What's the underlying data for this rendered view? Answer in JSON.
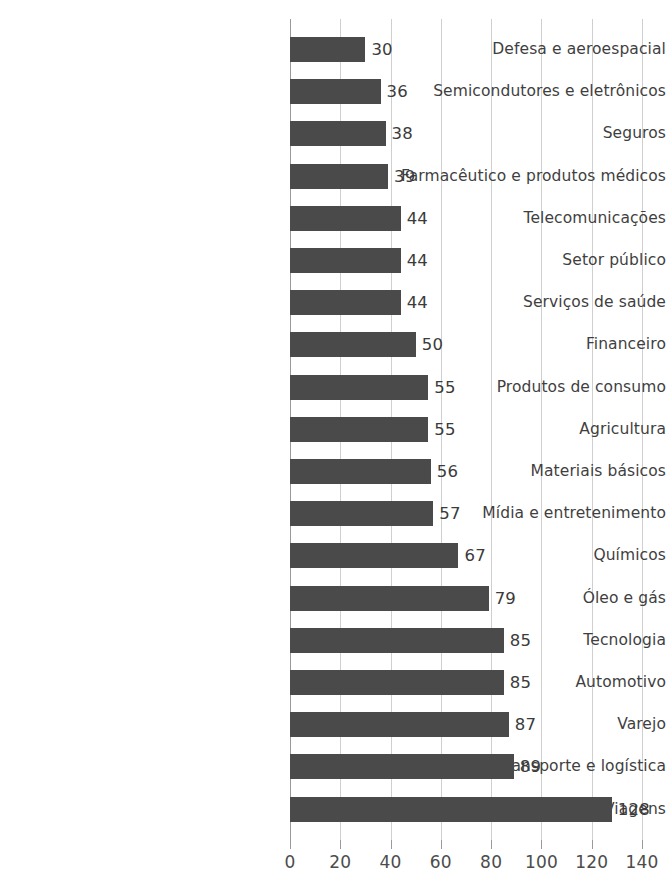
{
  "chart_data": {
    "type": "bar",
    "orientation": "horizontal",
    "title": "",
    "xlabel": "",
    "ylabel": "",
    "xlim": [
      0,
      140
    ],
    "xticks": [
      0,
      20,
      40,
      60,
      80,
      100,
      120,
      140
    ],
    "grid": true,
    "legend": false,
    "bar_color": "#4a4a4a",
    "grid_color": "#cfcfcf",
    "axis_color": "#9a9a9a",
    "text_color": "#3f3f3f",
    "categories": [
      "Defesa e aeroespacial",
      "Semicondutores e eletrônicos",
      "Seguros",
      "Farmacêutico e produtos médicos",
      "Telecomunicações",
      "Setor público",
      "Serviços de saúde",
      "Financeiro",
      "Produtos de consumo",
      "Agricultura",
      "Materiais básicos",
      "Mídia e entretenimento",
      "Químicos",
      "Óleo e gás",
      "Tecnologia",
      "Automotivo",
      "Varejo",
      "Transporte e logística",
      "Viagens"
    ],
    "values": [
      30,
      36,
      38,
      39,
      44,
      44,
      44,
      50,
      55,
      55,
      56,
      57,
      67,
      79,
      85,
      85,
      87,
      89,
      128
    ],
    "value_labels": [
      "30",
      "36",
      "38",
      "39",
      "44",
      "44",
      "44",
      "50",
      "55",
      "55",
      "56",
      "57",
      "67",
      "79",
      "85",
      "85",
      "87",
      "89",
      "128"
    ],
    "tick_labels": [
      "0",
      "20",
      "40",
      "60",
      "80",
      "100",
      "120",
      "140"
    ]
  }
}
